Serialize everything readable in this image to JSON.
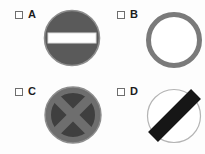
{
  "page": {
    "background_color": "#fdfdfd",
    "layout": "2x2-grid-of-multiple-choice-sign-options"
  },
  "options": [
    {
      "id": "a",
      "letter": "A",
      "checkbox_state": "unchecked",
      "figure": {
        "name": "no-entry-sign",
        "description": "solid dark gray filled circle with a horizontal white bar across the middle",
        "shape": "circle-with-horizontal-bar",
        "circle_fill": "#5a5a5a",
        "circle_stroke": "#8d8d8d",
        "bar_fill": "#ffffff",
        "bar_stroke": "#d9d9d9"
      }
    },
    {
      "id": "b",
      "letter": "B",
      "checkbox_state": "unchecked",
      "figure": {
        "name": "gray-ring-sign",
        "description": "thick gray ring outline with white interior",
        "shape": "ring",
        "ring_stroke": "#7a7a7a",
        "ring_fill": "#ffffff",
        "stroke_width_px": 5
      }
    },
    {
      "id": "c",
      "letter": "C",
      "checkbox_state": "unchecked",
      "figure": {
        "name": "circle-with-x-cross-sign",
        "description": "dark gray circle containing a lighter gray diagonal X cross and outer ring",
        "shape": "circle-with-x",
        "circle_fill": "#3f3f3f",
        "cross_fill": "#6e6e6e",
        "ring_stroke": "#6e6e6e",
        "outer_stroke": "#8d8d8d"
      }
    },
    {
      "id": "d",
      "letter": "D",
      "checkbox_state": "unchecked",
      "figure": {
        "name": "circle-with-diagonal-bar-sign",
        "description": "white circle with thin light gray outline crossed by a thick black diagonal bar running from lower-left to upper-right",
        "shape": "circle-with-diagonal-stripe",
        "circle_fill": "#ffffff",
        "circle_stroke": "#b4b4b4",
        "bar_fill": "#161616",
        "bar_angle_deg": 45
      }
    }
  ],
  "colors": {
    "checkbox_border": "#6e6e6e",
    "letter_color": "#1c1c1c",
    "background": "#fdfdfd"
  }
}
